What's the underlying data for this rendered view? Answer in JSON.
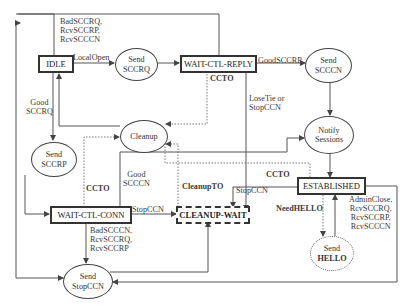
{
  "diagram": {
    "states": {
      "idle": "IDLE",
      "wait_ctl_reply": "WAIT-CTL-REPLY",
      "wait_ctl_conn": "WAIT-CTL-CONN",
      "cleanup_wait": "CLEANUP-WAIT",
      "established": "ESTABLISHED"
    },
    "actions": {
      "send_sccrq": [
        "Send",
        "SCCRQ"
      ],
      "send_scccn": [
        "Send",
        "SCCCN"
      ],
      "send_sccrp": [
        "Send",
        "SCCRP"
      ],
      "cleanup": [
        "Cleanup"
      ],
      "notify_sessions": [
        "Notify",
        "Sessions"
      ],
      "send_hello": [
        "Send",
        "HELLO"
      ],
      "send_stopccn": [
        "Send",
        "StopCCN"
      ]
    },
    "transitions": {
      "idle_bad": [
        "BadSCCRQ,",
        "RcvSCCRP,",
        "RcvSCCCN"
      ],
      "local_open": "LocalOpen",
      "good_sccrq": [
        "Good",
        "SCCRQ"
      ],
      "good_sccrp": "GoodSCCRP",
      "ccto_reply": "CCTO",
      "losetie": [
        "LoseTie or",
        "StopCCN"
      ],
      "ccto_conn": "CCTO",
      "good_scccn": [
        "Good",
        "SCCCN"
      ],
      "cleanup_to": "CleanupTO",
      "stopccn_conn": "StopCCN",
      "stopccn_est": "StopCCN",
      "ccto_est": "CCTO",
      "need_hello": "NeedHELLO",
      "est_close": [
        "AdminClose,",
        "RcvSCCRQ,",
        "RcvSCCRP,",
        "RcvSCCCN"
      ],
      "conn_bad": [
        "BadSCCCN,",
        "RcvSCCRQ,",
        "RcvSCCRP"
      ]
    }
  }
}
